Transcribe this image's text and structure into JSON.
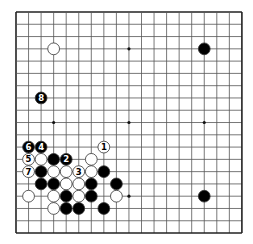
{
  "board": {
    "size": 19,
    "origin": {
      "x": 16,
      "y": 12
    },
    "spacing": {
      "x": 12.55,
      "y": 12.28
    },
    "line_color": "#555555",
    "border_color": "#222222",
    "background": "#ffffff",
    "stone_black": "#000000",
    "stone_white": "#ffffff",
    "stone_outline": "#333333",
    "hoshi": [
      [
        3,
        3
      ],
      [
        9,
        3
      ],
      [
        15,
        3
      ],
      [
        3,
        9
      ],
      [
        9,
        9
      ],
      [
        15,
        9
      ],
      [
        3,
        15
      ],
      [
        9,
        15
      ],
      [
        15,
        15
      ]
    ]
  },
  "stones": [
    {
      "color": "white",
      "col": 3,
      "row": 3
    },
    {
      "color": "black",
      "col": 15,
      "row": 3
    },
    {
      "color": "black",
      "col": 2,
      "row": 7,
      "label": "8"
    },
    {
      "color": "black",
      "col": 1,
      "row": 11,
      "label": "6"
    },
    {
      "color": "black",
      "col": 2,
      "row": 11,
      "label": "4"
    },
    {
      "color": "white",
      "col": 7,
      "row": 11,
      "label": "1"
    },
    {
      "color": "white",
      "col": 1,
      "row": 12,
      "label": "5"
    },
    {
      "color": "white",
      "col": 2,
      "row": 12
    },
    {
      "color": "black",
      "col": 3,
      "row": 12
    },
    {
      "color": "black",
      "col": 4,
      "row": 12,
      "label": "2"
    },
    {
      "color": "white",
      "col": 6,
      "row": 12
    },
    {
      "color": "white",
      "col": 1,
      "row": 13,
      "label": "7"
    },
    {
      "color": "black",
      "col": 2,
      "row": 13
    },
    {
      "color": "white",
      "col": 3,
      "row": 13
    },
    {
      "color": "white",
      "col": 4,
      "row": 13
    },
    {
      "color": "white",
      "col": 5,
      "row": 13,
      "label": "3"
    },
    {
      "color": "white",
      "col": 6,
      "row": 13
    },
    {
      "color": "black",
      "col": 7,
      "row": 13
    },
    {
      "color": "black",
      "col": 2,
      "row": 14
    },
    {
      "color": "black",
      "col": 3,
      "row": 14
    },
    {
      "color": "white",
      "col": 4,
      "row": 14
    },
    {
      "color": "white",
      "col": 5,
      "row": 14
    },
    {
      "color": "black",
      "col": 6,
      "row": 14
    },
    {
      "color": "black",
      "col": 8,
      "row": 14
    },
    {
      "color": "white",
      "col": 1,
      "row": 15
    },
    {
      "color": "white",
      "col": 3,
      "row": 15
    },
    {
      "color": "black",
      "col": 4,
      "row": 15
    },
    {
      "color": "white",
      "col": 5,
      "row": 15
    },
    {
      "color": "black",
      "col": 6,
      "row": 15
    },
    {
      "color": "white",
      "col": 8,
      "row": 15
    },
    {
      "color": "black",
      "col": 15,
      "row": 15
    },
    {
      "color": "white",
      "col": 3,
      "row": 16
    },
    {
      "color": "black",
      "col": 4,
      "row": 16
    },
    {
      "color": "black",
      "col": 5,
      "row": 16
    },
    {
      "color": "black",
      "col": 7,
      "row": 16
    }
  ]
}
